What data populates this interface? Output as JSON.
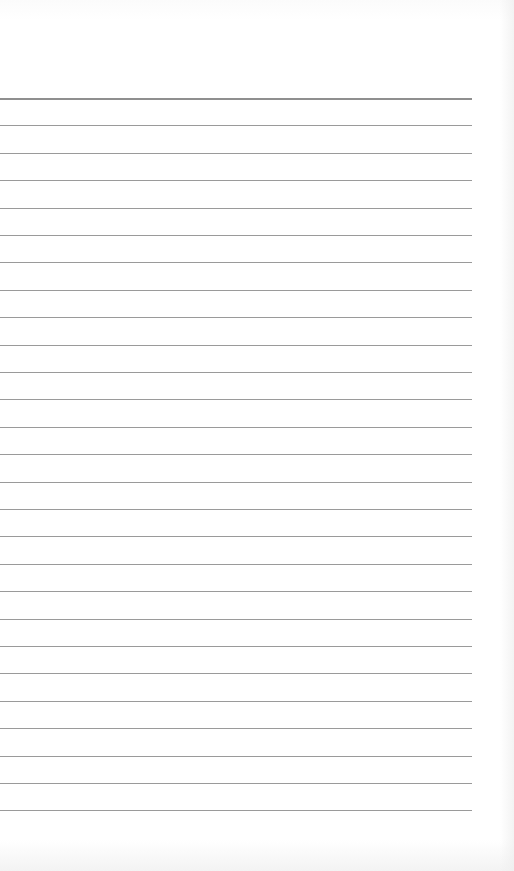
{
  "document": {
    "type": "lined-paper",
    "background_color": "#ffffff",
    "line_color": "#9a9a9a",
    "line_count": 27,
    "first_line_y": 98,
    "line_spacing": 27.4,
    "line_left": 0,
    "line_right": 472,
    "text": ""
  }
}
